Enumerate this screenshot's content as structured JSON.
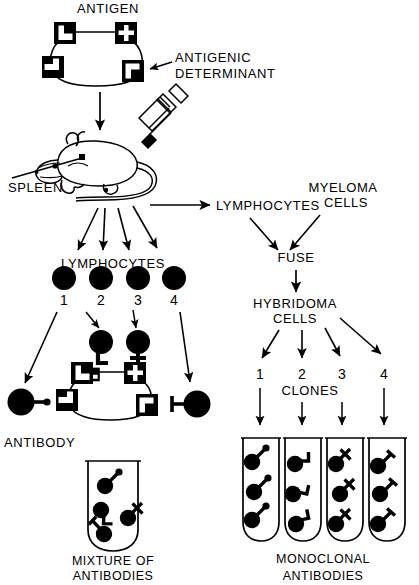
{
  "diagram": {
    "title_text": "Monoclonal antibody production via hybridoma technique",
    "colors": {
      "ink": "#000000",
      "background": "#ffffff"
    },
    "labels": {
      "antigen": "ANTIGEN",
      "antigenic_determinant_line1": "ANTIGENIC",
      "antigenic_determinant_line2": "DETERMINANT",
      "spleen": "SPLEEN",
      "lymphocytes_left": "LYMPHOCYTES",
      "lymphocytes_right": "LYMPHOCYTES",
      "myeloma_line1": "MYELOMA",
      "myeloma_line2": "CELLS",
      "fuse": "FUSE",
      "hybridoma_line1": "HYBRIDOMA",
      "hybridoma_line2": "CELLS",
      "clones": "CLONES",
      "antibody": "ANTIBODY",
      "mixture_line1": "MIXTURE  OF",
      "mixture_line2": "ANTIBODIES",
      "monoclonal_line1": "MONOCLONAL",
      "monoclonal_line2": "ANTIBODIES"
    },
    "lymphocyte_numbers": [
      "1",
      "2",
      "3",
      "4"
    ],
    "clone_numbers": [
      "1",
      "2",
      "3",
      "4"
    ],
    "antigen_determinant_shapes": [
      "notch-left-up",
      "notch-cross",
      "notch-bar-left",
      "notch-right-down"
    ],
    "lymphocyte_receptors": [
      {
        "number": "1",
        "receptor": "none-shown"
      },
      {
        "number": "2",
        "receptor": "hook-L"
      },
      {
        "number": "3",
        "receptor": "cross"
      },
      {
        "number": "4",
        "receptor": "none-shown"
      }
    ],
    "mixture_tube": {
      "caption_line1": "MIXTURE  OF",
      "caption_line2": "ANTIBODIES",
      "antibody_count": 4,
      "antibody_kinds": [
        "stem-diagonal",
        "hook-L",
        "cross",
        "bar-T"
      ]
    },
    "monoclonal_tubes": [
      {
        "clone": "1",
        "antibody_kind": "stem-diagonal",
        "antibody_count": 3
      },
      {
        "clone": "2",
        "antibody_kind": "hook-L",
        "antibody_count": 3
      },
      {
        "clone": "3",
        "antibody_kind": "cross",
        "antibody_count": 3
      },
      {
        "clone": "4",
        "antibody_kind": "bar-T",
        "antibody_count": 3
      }
    ],
    "icons": {
      "mouse": "mouse-icon",
      "syringe": "syringe-icon",
      "test_tube": "test-tube-icon",
      "arrow": "arrow-icon",
      "cell": "cell-icon",
      "antigen": "antigen-icon",
      "antibody": "antibody-icon"
    }
  }
}
